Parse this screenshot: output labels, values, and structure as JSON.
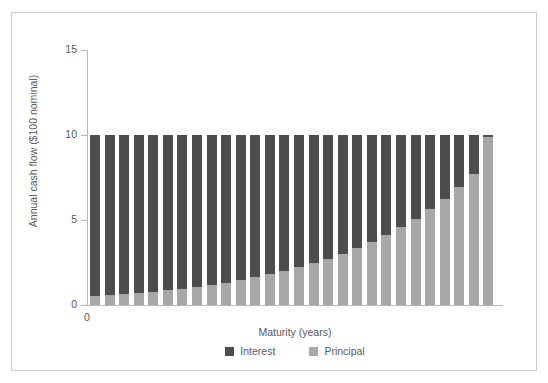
{
  "chart_data": {
    "type": "bar",
    "stacked": true,
    "title": "",
    "xlabel": "Maturity (years)",
    "ylabel": "Annual cash flow ($100 nominal)",
    "ylim": [
      0,
      15
    ],
    "yticks": [
      0,
      5,
      10,
      15
    ],
    "ytick_labels": [
      "0",
      "5",
      "10",
      "15"
    ],
    "xtick_labels": [
      "0"
    ],
    "grid": false,
    "legend_position": "bottom",
    "bar_count": 28,
    "categories": [
      1,
      2,
      3,
      4,
      5,
      6,
      7,
      8,
      9,
      10,
      11,
      12,
      13,
      14,
      15,
      16,
      17,
      18,
      19,
      20,
      21,
      22,
      23,
      24,
      25,
      26,
      27,
      28
    ],
    "series": [
      {
        "name": "Principal",
        "color": "#a8a8a8",
        "values": [
          0.52,
          0.58,
          0.64,
          0.71,
          0.79,
          0.87,
          0.97,
          1.07,
          1.19,
          1.32,
          1.46,
          1.62,
          1.8,
          1.99,
          2.21,
          2.45,
          2.72,
          3.02,
          3.35,
          3.71,
          4.12,
          4.57,
          5.07,
          5.63,
          6.24,
          6.93,
          7.69,
          9.86
        ]
      },
      {
        "name": "Interest",
        "color": "#4d4d4d",
        "values": [
          9.48,
          9.42,
          9.36,
          9.29,
          9.21,
          9.13,
          9.03,
          8.93,
          8.81,
          8.68,
          8.54,
          8.38,
          8.2,
          8.01,
          7.79,
          7.55,
          7.28,
          6.98,
          6.65,
          6.29,
          5.88,
          5.43,
          4.93,
          4.37,
          3.76,
          3.07,
          2.31,
          0.14
        ]
      }
    ],
    "totals": [
      10,
      10,
      10,
      10,
      10,
      10,
      10,
      10,
      10,
      10,
      10,
      10,
      10,
      10,
      10,
      10,
      10,
      10,
      10,
      10,
      10,
      10,
      10,
      10,
      10,
      10,
      10,
      10
    ]
  },
  "legend": {
    "items": [
      {
        "label": "Interest",
        "color": "#4d4d4d"
      },
      {
        "label": "Principal",
        "color": "#a8a8a8"
      }
    ]
  }
}
